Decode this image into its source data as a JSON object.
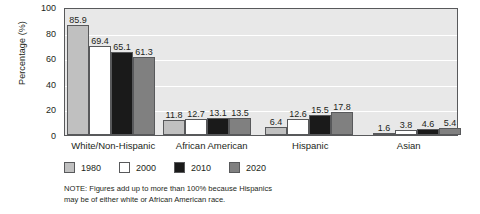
{
  "chart_data": {
    "type": "bar",
    "title": "",
    "xlabel": "",
    "ylabel": "Percentage (%)",
    "ylim": [
      0,
      100
    ],
    "ytick_values": [
      0,
      20,
      40,
      60,
      80,
      100
    ],
    "ytick_labels": [
      "0",
      "20",
      "40",
      "60",
      "80",
      "100"
    ],
    "grid": true,
    "grid_orientation": "horizontal",
    "legend_position": "bottom-left",
    "categories": [
      "White/Non-Hispanic",
      "African American",
      "Hispanic",
      "Asian"
    ],
    "series": [
      {
        "name": "1980",
        "color": "#c0c0c0",
        "values": [
          85.9,
          11.8,
          6.4,
          1.6
        ]
      },
      {
        "name": "2000",
        "color": "#ffffff",
        "values": [
          69.4,
          12.7,
          12.6,
          3.8
        ]
      },
      {
        "name": "2010",
        "color": "#1a1a1a",
        "values": [
          65.1,
          13.1,
          15.5,
          4.6
        ]
      },
      {
        "name": "2020",
        "color": "#808080",
        "values": [
          61.3,
          13.5,
          17.8,
          5.4
        ]
      }
    ],
    "value_labels": [
      [
        "85.9",
        "69.4",
        "65.1",
        "61.3"
      ],
      [
        "11.8",
        "12.7",
        "13.1",
        "13.5"
      ],
      [
        "6.4",
        "12.6",
        "15.5",
        "17.8"
      ],
      [
        "1.6",
        "3.8",
        "4.6",
        "5.4"
      ]
    ],
    "note_lines": [
      "NOTE: Figures add up to more than 100% because Hispanics",
      "may be of either white or African American race."
    ]
  },
  "colors": {
    "plot_background": "#e8e8e8",
    "gridline": "#ffffff",
    "axis": "#58595b",
    "text": "#231f20"
  }
}
